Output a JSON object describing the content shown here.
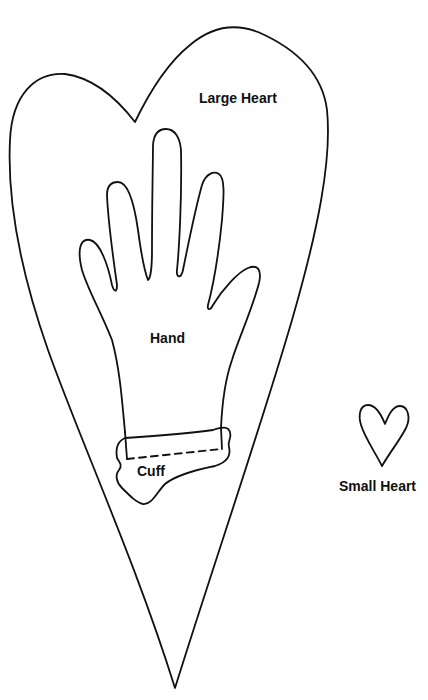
{
  "pattern": {
    "pieces": [
      {
        "id": "large-heart",
        "label": "Large Heart"
      },
      {
        "id": "hand",
        "label": "Hand"
      },
      {
        "id": "cuff",
        "label": "Cuff"
      },
      {
        "id": "small-heart",
        "label": "Small Heart"
      }
    ],
    "colors": {
      "line": "#111111",
      "background": "#ffffff"
    }
  }
}
